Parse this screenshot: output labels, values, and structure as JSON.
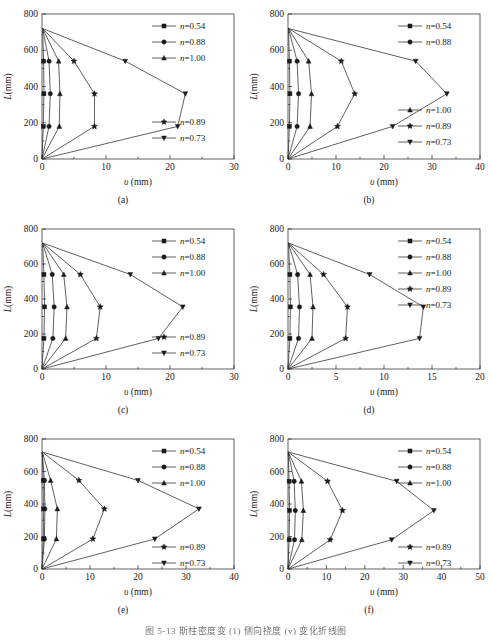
{
  "figure": {
    "caption": "图 5-13  斯柱密度变 (1) 侧向挠度 (v) 变化折线图",
    "panel_labels": [
      "(a)",
      "(b)",
      "(c)",
      "(d)",
      "(e)",
      "(f)"
    ],
    "axis": {
      "ylabel_italic": "L",
      "ylabel_unit": "(mm)",
      "xlabel_italic": "υ",
      "xlabel_unit": " (mm)"
    },
    "colors": {
      "line": "#2b2b2b",
      "axis": "#3a3a3a",
      "text": "#1b1b1b",
      "background": "#ffffff"
    }
  },
  "chart_data": [
    {
      "type": "line",
      "panel": "(a)",
      "title": "",
      "xlabel": "υ (mm)",
      "ylabel": "L(mm)",
      "xlim": [
        0,
        30
      ],
      "ylim": [
        0,
        800
      ],
      "xticks": [
        0,
        10,
        20,
        30
      ],
      "yticks": [
        0,
        200,
        400,
        600,
        800
      ],
      "grid": false,
      "legend_position": "top-right + bottom-right",
      "legend": [
        "n=0.54",
        "n=0.88",
        "n=1.00",
        "n=0.89",
        "n=0.73"
      ],
      "series": [
        {
          "name": "n=0.54",
          "marker": "square",
          "x": [
            0,
            0.2,
            0.3,
            0.25,
            0.1
          ],
          "y": [
            0,
            180,
            360,
            540,
            720
          ]
        },
        {
          "name": "n=0.88",
          "marker": "circle",
          "x": [
            0,
            1.1,
            1.3,
            1.1,
            0.1
          ],
          "y": [
            0,
            180,
            360,
            540,
            720
          ]
        },
        {
          "name": "n=1.00",
          "marker": "triangle-up",
          "x": [
            0,
            2.7,
            2.8,
            2.6,
            0.1
          ],
          "y": [
            0,
            180,
            360,
            540,
            720
          ]
        },
        {
          "name": "n=0.89",
          "marker": "star",
          "x": [
            0,
            8.2,
            8.2,
            5.0,
            0.1
          ],
          "y": [
            0,
            180,
            360,
            540,
            720
          ]
        },
        {
          "name": "n=0.73",
          "marker": "triangle-down",
          "x": [
            0,
            21.2,
            22.4,
            13.0,
            0.1
          ],
          "y": [
            0,
            180,
            360,
            540,
            720
          ]
        }
      ]
    },
    {
      "type": "line",
      "panel": "(b)",
      "title": "",
      "xlabel": "υ (mm)",
      "ylabel": "L(mm)",
      "xlim": [
        0,
        40
      ],
      "ylim": [
        0,
        800
      ],
      "xticks": [
        0,
        10,
        20,
        30,
        40
      ],
      "yticks": [
        0,
        200,
        400,
        600,
        800
      ],
      "grid": false,
      "legend_position": "top-right + middle-right",
      "legend": [
        "n=0.54",
        "n=0.88",
        "n=1.00",
        "n=0.89",
        "n=0.73"
      ],
      "series": [
        {
          "name": "n=0.54",
          "marker": "square",
          "x": [
            0,
            0.3,
            0.4,
            0.3,
            0.1
          ],
          "y": [
            0,
            180,
            360,
            540,
            720
          ]
        },
        {
          "name": "n=0.88",
          "marker": "circle",
          "x": [
            0,
            1.9,
            2.2,
            1.9,
            0.1
          ],
          "y": [
            0,
            180,
            360,
            540,
            720
          ]
        },
        {
          "name": "n=1.00",
          "marker": "triangle-up",
          "x": [
            0,
            4.6,
            4.9,
            4.3,
            0.1
          ],
          "y": [
            0,
            180,
            360,
            540,
            720
          ]
        },
        {
          "name": "n=0.89",
          "marker": "star",
          "x": [
            0,
            10.3,
            13.9,
            11.1,
            0.1
          ],
          "y": [
            0,
            180,
            360,
            540,
            720
          ]
        },
        {
          "name": "n=0.73",
          "marker": "triangle-down",
          "x": [
            0,
            21.8,
            33.1,
            26.6,
            0.1
          ],
          "y": [
            0,
            180,
            360,
            540,
            720
          ]
        }
      ]
    },
    {
      "type": "line",
      "panel": "(c)",
      "title": "",
      "xlabel": "υ (mm)",
      "ylabel": "L(mm)",
      "xlim": [
        0,
        30
      ],
      "ylim": [
        0,
        800
      ],
      "xticks": [
        0,
        10,
        20,
        30
      ],
      "yticks": [
        0,
        200,
        400,
        600,
        800
      ],
      "grid": false,
      "legend_position": "top-right + bottom-right",
      "legend": [
        "n=0.54",
        "n=0.88",
        "n=1.00",
        "n=0.89",
        "n=0.73"
      ],
      "series": [
        {
          "name": "n=0.54",
          "marker": "square",
          "x": [
            0,
            0.3,
            0.4,
            0.3,
            0.1
          ],
          "y": [
            0,
            175,
            355,
            540,
            720
          ]
        },
        {
          "name": "n=0.88",
          "marker": "circle",
          "x": [
            0,
            1.7,
            1.9,
            1.6,
            0.1
          ],
          "y": [
            0,
            175,
            355,
            540,
            720
          ]
        },
        {
          "name": "n=1.00",
          "marker": "triangle-up",
          "x": [
            0,
            3.7,
            3.9,
            3.4,
            0.1
          ],
          "y": [
            0,
            175,
            355,
            540,
            720
          ]
        },
        {
          "name": "n=0.89",
          "marker": "star",
          "x": [
            0,
            8.5,
            9.1,
            6.0,
            0.1
          ],
          "y": [
            0,
            175,
            355,
            540,
            720
          ]
        },
        {
          "name": "n=0.73",
          "marker": "triangle-down",
          "x": [
            0,
            18.2,
            22.0,
            13.8,
            0.1
          ],
          "y": [
            0,
            175,
            355,
            540,
            720
          ]
        }
      ]
    },
    {
      "type": "line",
      "panel": "(d)",
      "title": "",
      "xlabel": "υ (mm)",
      "ylabel": "L(mm)",
      "xlim": [
        0,
        20
      ],
      "ylim": [
        0,
        800
      ],
      "xticks": [
        0,
        5,
        10,
        15,
        20
      ],
      "yticks": [
        0,
        200,
        400,
        600,
        800
      ],
      "grid": false,
      "legend_position": "top-right",
      "legend": [
        "n=0.54",
        "n=0.88",
        "n=1.00",
        "n=0.89",
        "n=0.73"
      ],
      "series": [
        {
          "name": "n=0.54",
          "marker": "square",
          "x": [
            0,
            0.2,
            0.25,
            0.2,
            0.05
          ],
          "y": [
            0,
            175,
            355,
            540,
            720
          ]
        },
        {
          "name": "n=0.88",
          "marker": "circle",
          "x": [
            0,
            1.1,
            1.2,
            1.0,
            0.05
          ],
          "y": [
            0,
            175,
            355,
            540,
            720
          ]
        },
        {
          "name": "n=1.00",
          "marker": "triangle-up",
          "x": [
            0,
            2.5,
            2.6,
            2.3,
            0.05
          ],
          "y": [
            0,
            175,
            355,
            540,
            720
          ]
        },
        {
          "name": "n=0.89",
          "marker": "star",
          "x": [
            0,
            6.0,
            6.2,
            3.7,
            0.05
          ],
          "y": [
            0,
            175,
            355,
            540,
            720
          ]
        },
        {
          "name": "n=0.73",
          "marker": "triangle-down",
          "x": [
            0,
            13.7,
            14.1,
            8.5,
            0.05
          ],
          "y": [
            0,
            175,
            355,
            540,
            720
          ]
        }
      ]
    },
    {
      "type": "line",
      "panel": "(e)",
      "title": "",
      "xlabel": "υ (mm)",
      "ylabel": "L(mm)",
      "xlim": [
        0,
        40
      ],
      "ylim": [
        0,
        800
      ],
      "xticks": [
        0,
        10,
        20,
        30,
        40
      ],
      "yticks": [
        0,
        200,
        400,
        600,
        800
      ],
      "grid": false,
      "legend_position": "top-right + bottom-right",
      "legend": [
        "n=0.54",
        "n=0.88",
        "n=1.00",
        "n=0.89",
        "n=0.73"
      ],
      "series": [
        {
          "name": "n=0.54",
          "marker": "square",
          "x": [
            0,
            0.3,
            0.3,
            0.25,
            0.05
          ],
          "y": [
            0,
            185,
            370,
            545,
            720
          ]
        },
        {
          "name": "n=0.88",
          "marker": "circle",
          "x": [
            0,
            0.5,
            0.6,
            0.5,
            0.05
          ],
          "y": [
            0,
            185,
            370,
            545,
            720
          ]
        },
        {
          "name": "n=1.00",
          "marker": "triangle-up",
          "x": [
            0,
            3.0,
            3.2,
            1.8,
            0.05
          ],
          "y": [
            0,
            185,
            370,
            545,
            720
          ]
        },
        {
          "name": "n=0.89",
          "marker": "star",
          "x": [
            0,
            10.6,
            13.0,
            7.7,
            0.05
          ],
          "y": [
            0,
            185,
            370,
            545,
            720
          ]
        },
        {
          "name": "n=0.73",
          "marker": "triangle-down",
          "x": [
            0,
            23.5,
            32.7,
            20.0,
            0.05
          ],
          "y": [
            0,
            185,
            370,
            545,
            720
          ]
        }
      ]
    },
    {
      "type": "line",
      "panel": "(f)",
      "title": "",
      "xlabel": "υ (mm)",
      "ylabel": "L(mm)",
      "xlim": [
        0,
        50
      ],
      "ylim": [
        0,
        800
      ],
      "xticks": [
        0,
        10,
        20,
        30,
        40,
        50
      ],
      "yticks": [
        0,
        200,
        400,
        600,
        800
      ],
      "grid": false,
      "legend_position": "top-right + bottom-right",
      "legend": [
        "n=0.54",
        "n=0.88",
        "n=1.00",
        "n=0.89",
        "n=0.73"
      ],
      "series": [
        {
          "name": "n=0.54",
          "marker": "square",
          "x": [
            0,
            0.3,
            0.4,
            0.3,
            0.05
          ],
          "y": [
            0,
            180,
            360,
            540,
            720
          ]
        },
        {
          "name": "n=0.88",
          "marker": "circle",
          "x": [
            0,
            1.7,
            1.9,
            1.6,
            0.05
          ],
          "y": [
            0,
            180,
            360,
            540,
            720
          ]
        },
        {
          "name": "n=1.00",
          "marker": "triangle-up",
          "x": [
            0,
            3.6,
            4.0,
            3.5,
            0.05
          ],
          "y": [
            0,
            180,
            360,
            540,
            720
          ]
        },
        {
          "name": "n=0.89",
          "marker": "star",
          "x": [
            0,
            11.0,
            14.2,
            10.3,
            0.05
          ],
          "y": [
            0,
            180,
            360,
            540,
            720
          ]
        },
        {
          "name": "n=0.73",
          "marker": "triangle-down",
          "x": [
            0,
            27.0,
            38.0,
            28.3,
            0.05
          ],
          "y": [
            0,
            180,
            360,
            540,
            720
          ]
        }
      ]
    }
  ]
}
